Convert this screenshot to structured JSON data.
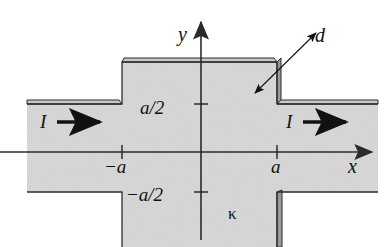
{
  "figure": {
    "type": "technical-diagram",
    "colors": {
      "plate_fill": "#d6d6d6",
      "plate_edge_dark": "#8f8f8f",
      "outline": "#2b2b2b",
      "axis": "#2b2b2b",
      "background": "#ffffff",
      "label_text": "#111111"
    },
    "labels": {
      "y_axis": "y",
      "x_axis": "x",
      "thickness": "d",
      "half_width_positive": "a/2",
      "half_width_negative": "−a/2",
      "x_negative_a": "−a",
      "x_positive_a": "a",
      "current_left": "I",
      "current_right": "I",
      "conductivity": "κ"
    },
    "geometry": {
      "origin": {
        "x": 201,
        "y": 152
      },
      "tick_minus_a_x": 122,
      "tick_plus_a_x": 277,
      "tick_a_over_2_y": 104,
      "tick_minus_a_over_2_y": 192,
      "wide_section_top_y": 62,
      "plate_left_x": 27,
      "plate_right_x": 378,
      "thickness_band_px": 5
    },
    "annotations": {
      "current_direction": "left-to-right",
      "arrow_style": "solid-filled-triangle",
      "dimension_arrow": "double-headed",
      "axes_arrowheads": [
        "y-up",
        "x-right"
      ]
    }
  }
}
